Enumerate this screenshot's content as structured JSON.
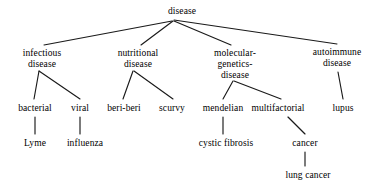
{
  "diagram": {
    "type": "hierarchy-tree",
    "background_color": "#ffffff",
    "text_color": "#000000",
    "edge_color": "#1a1a1a",
    "nodes": [
      {
        "id": "disease",
        "label": "disease",
        "x": 182,
        "y": 6,
        "level": 0
      },
      {
        "id": "infectious",
        "label": "infectious\ndisease",
        "x": 42,
        "y": 48,
        "level": 1
      },
      {
        "id": "nutritional",
        "label": "nutritional\ndisease",
        "x": 138,
        "y": 48,
        "level": 1
      },
      {
        "id": "molecular",
        "label": "molecular-\ngenetics-\ndisease",
        "x": 235,
        "y": 48,
        "level": 1
      },
      {
        "id": "autoimmune",
        "label": "autoimmune\ndisease",
        "x": 337,
        "y": 47,
        "level": 1
      },
      {
        "id": "bacterial",
        "label": "bacterial",
        "x": 35,
        "y": 103,
        "level": 2
      },
      {
        "id": "viral",
        "label": "viral",
        "x": 80,
        "y": 103,
        "level": 2
      },
      {
        "id": "beriberi",
        "label": "beri-beri",
        "x": 124,
        "y": 103,
        "level": 2
      },
      {
        "id": "scurvy",
        "label": "scurvy",
        "x": 172,
        "y": 103,
        "level": 2
      },
      {
        "id": "mendelian",
        "label": "mendelian",
        "x": 223,
        "y": 103,
        "level": 2
      },
      {
        "id": "multifactorial",
        "label": "multifactorial",
        "x": 278,
        "y": 103,
        "level": 2
      },
      {
        "id": "lupus",
        "label": "lupus",
        "x": 343,
        "y": 103,
        "level": 2
      },
      {
        "id": "lyme",
        "label": "Lyme",
        "x": 35,
        "y": 138,
        "level": 3
      },
      {
        "id": "influenza",
        "label": "influenza",
        "x": 85,
        "y": 138,
        "level": 3
      },
      {
        "id": "cysticfibrosis",
        "label": "cystic fibrosis",
        "x": 226,
        "y": 138,
        "level": 3
      },
      {
        "id": "cancer",
        "label": "cancer",
        "x": 305,
        "y": 138,
        "level": 3
      },
      {
        "id": "lungcancer",
        "label": "lung cancer",
        "x": 308,
        "y": 170,
        "level": 4
      }
    ],
    "edges": [
      {
        "from": "disease",
        "to": "infectious",
        "x1": 172,
        "y1": 21,
        "x2": 44,
        "y2": 45
      },
      {
        "from": "disease",
        "to": "nutritional",
        "x1": 173,
        "y1": 21,
        "x2": 141,
        "y2": 45
      },
      {
        "from": "disease",
        "to": "molecular",
        "x1": 174,
        "y1": 21,
        "x2": 231,
        "y2": 45
      },
      {
        "from": "disease",
        "to": "autoimmune",
        "x1": 174,
        "y1": 20,
        "x2": 337,
        "y2": 44
      },
      {
        "from": "infectious",
        "to": "bacterial",
        "x1": 39,
        "y1": 71,
        "x2": 34,
        "y2": 99
      },
      {
        "from": "infectious",
        "to": "viral",
        "x1": 39,
        "y1": 71,
        "x2": 80,
        "y2": 99
      },
      {
        "from": "nutritional",
        "to": "beriberi",
        "x1": 133,
        "y1": 71,
        "x2": 123,
        "y2": 99
      },
      {
        "from": "nutritional",
        "to": "scurvy",
        "x1": 134,
        "y1": 71,
        "x2": 173,
        "y2": 99
      },
      {
        "from": "molecular",
        "to": "mendelian",
        "x1": 233,
        "y1": 81,
        "x2": 223,
        "y2": 99
      },
      {
        "from": "molecular",
        "to": "multifactorial",
        "x1": 234,
        "y1": 81,
        "x2": 281,
        "y2": 99
      },
      {
        "from": "autoimmune",
        "to": "lupus",
        "x1": 338,
        "y1": 72,
        "x2": 343,
        "y2": 99
      },
      {
        "from": "bacterial",
        "to": "lyme",
        "x1": 35,
        "y1": 117,
        "x2": 35,
        "y2": 134
      },
      {
        "from": "viral",
        "to": "influenza",
        "x1": 80,
        "y1": 117,
        "x2": 80,
        "y2": 134
      },
      {
        "from": "mendelian",
        "to": "cysticfibrosis",
        "x1": 223,
        "y1": 117,
        "x2": 223,
        "y2": 134
      },
      {
        "from": "multifactorial",
        "to": "cancer",
        "x1": 288,
        "y1": 117,
        "x2": 305,
        "y2": 134
      },
      {
        "from": "cancer",
        "to": "lungcancer",
        "x1": 305,
        "y1": 152,
        "x2": 305,
        "y2": 166
      }
    ]
  }
}
